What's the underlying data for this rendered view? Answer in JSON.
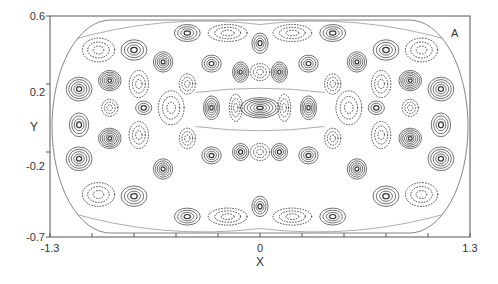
{
  "chart_data": {
    "type": "contour",
    "title": "",
    "panel_label": "A",
    "xlabel": "X",
    "ylabel": "Y",
    "xlim": [
      -1.3,
      1.3
    ],
    "ylim": [
      -0.7,
      0.6
    ],
    "x_ticks": [
      {
        "value": -1.3,
        "label": "-1.3"
      },
      {
        "value": 0,
        "label": "0"
      },
      {
        "value": 1.3,
        "label": "1.3"
      }
    ],
    "x_minor_ticks": [
      -1.04,
      -0.78,
      -0.52,
      -0.26,
      0.26,
      0.52,
      0.78,
      1.04
    ],
    "y_ticks": [
      {
        "value": 0.6,
        "label": "0.6"
      },
      {
        "value": 0.2,
        "label": "0.2"
      },
      {
        "value": -0.2,
        "label": "-0.2"
      },
      {
        "value": -0.7,
        "label": "-0.7"
      }
    ],
    "grid": false,
    "legend": null,
    "boundary": "stadium (rounded ends) enclosing the field, symmetric about x=0 and y≈-0.05",
    "line_styles": {
      "positive": "solid",
      "negative": "dotted"
    },
    "lobes": [
      {
        "x": -1.12,
        "y": 0.17,
        "rx": 0.08,
        "ry": 0.07,
        "sign": "+",
        "levels": 5
      },
      {
        "x": -1.12,
        "y": -0.24,
        "rx": 0.08,
        "ry": 0.07,
        "sign": "+",
        "levels": 5
      },
      {
        "x": -1.12,
        "y": -0.04,
        "rx": 0.06,
        "ry": 0.07,
        "sign": "+",
        "levels": 4
      },
      {
        "x": -0.93,
        "y": 0.22,
        "rx": 0.07,
        "ry": 0.06,
        "sign": "+",
        "levels": 6
      },
      {
        "x": -0.93,
        "y": -0.12,
        "rx": 0.07,
        "ry": 0.06,
        "sign": "+",
        "levels": 6
      },
      {
        "x": -0.93,
        "y": 0.06,
        "rx": 0.05,
        "ry": 0.05,
        "sign": "-",
        "levels": 3
      },
      {
        "x": -0.78,
        "y": 0.4,
        "rx": 0.08,
        "ry": 0.06,
        "sign": "+",
        "levels": 4
      },
      {
        "x": -0.78,
        "y": -0.46,
        "rx": 0.08,
        "ry": 0.06,
        "sign": "+",
        "levels": 4
      },
      {
        "x": -0.72,
        "y": 0.06,
        "rx": 0.05,
        "ry": 0.04,
        "sign": "+",
        "levels": 3
      },
      {
        "x": -0.6,
        "y": 0.33,
        "rx": 0.06,
        "ry": 0.06,
        "sign": "+",
        "levels": 5
      },
      {
        "x": -0.6,
        "y": -0.3,
        "rx": 0.06,
        "ry": 0.06,
        "sign": "+",
        "levels": 5
      },
      {
        "x": -0.45,
        "y": 0.5,
        "rx": 0.08,
        "ry": 0.05,
        "sign": "+",
        "levels": 4
      },
      {
        "x": -0.45,
        "y": -0.58,
        "rx": 0.08,
        "ry": 0.05,
        "sign": "+",
        "levels": 4
      },
      {
        "x": -0.3,
        "y": 0.06,
        "rx": 0.05,
        "ry": 0.07,
        "sign": "+",
        "levels": 5
      },
      {
        "x": -0.3,
        "y": 0.32,
        "rx": 0.06,
        "ry": 0.05,
        "sign": "+",
        "levels": 4
      },
      {
        "x": -0.3,
        "y": -0.22,
        "rx": 0.06,
        "ry": 0.05,
        "sign": "+",
        "levels": 4
      },
      {
        "x": -0.12,
        "y": 0.27,
        "rx": 0.05,
        "ry": 0.06,
        "sign": "+",
        "levels": 5
      },
      {
        "x": -0.12,
        "y": -0.2,
        "rx": 0.05,
        "ry": 0.05,
        "sign": "+",
        "levels": 4
      },
      {
        "x": 0.0,
        "y": 0.06,
        "rx": 0.12,
        "ry": 0.06,
        "sign": "+",
        "levels": 6
      },
      {
        "x": 0.0,
        "y": 0.44,
        "rx": 0.05,
        "ry": 0.06,
        "sign": "+",
        "levels": 4
      },
      {
        "x": 0.0,
        "y": -0.52,
        "rx": 0.05,
        "ry": 0.06,
        "sign": "+",
        "levels": 4
      },
      {
        "x": 0.12,
        "y": 0.27,
        "rx": 0.05,
        "ry": 0.06,
        "sign": "+",
        "levels": 5
      },
      {
        "x": 0.12,
        "y": -0.2,
        "rx": 0.05,
        "ry": 0.05,
        "sign": "+",
        "levels": 4
      },
      {
        "x": 0.3,
        "y": 0.06,
        "rx": 0.05,
        "ry": 0.07,
        "sign": "+",
        "levels": 5
      },
      {
        "x": 0.3,
        "y": 0.32,
        "rx": 0.06,
        "ry": 0.05,
        "sign": "+",
        "levels": 4
      },
      {
        "x": 0.3,
        "y": -0.22,
        "rx": 0.06,
        "ry": 0.05,
        "sign": "+",
        "levels": 4
      },
      {
        "x": 0.45,
        "y": 0.5,
        "rx": 0.08,
        "ry": 0.05,
        "sign": "+",
        "levels": 4
      },
      {
        "x": 0.45,
        "y": -0.58,
        "rx": 0.08,
        "ry": 0.05,
        "sign": "+",
        "levels": 4
      },
      {
        "x": 0.6,
        "y": 0.33,
        "rx": 0.06,
        "ry": 0.06,
        "sign": "+",
        "levels": 5
      },
      {
        "x": 0.6,
        "y": -0.3,
        "rx": 0.06,
        "ry": 0.06,
        "sign": "+",
        "levels": 5
      },
      {
        "x": 0.72,
        "y": 0.06,
        "rx": 0.05,
        "ry": 0.04,
        "sign": "+",
        "levels": 3
      },
      {
        "x": 0.78,
        "y": 0.4,
        "rx": 0.08,
        "ry": 0.06,
        "sign": "+",
        "levels": 4
      },
      {
        "x": 0.78,
        "y": -0.46,
        "rx": 0.08,
        "ry": 0.06,
        "sign": "+",
        "levels": 4
      },
      {
        "x": 0.93,
        "y": 0.22,
        "rx": 0.07,
        "ry": 0.06,
        "sign": "+",
        "levels": 6
      },
      {
        "x": 0.93,
        "y": -0.12,
        "rx": 0.07,
        "ry": 0.06,
        "sign": "+",
        "levels": 6
      },
      {
        "x": 0.93,
        "y": 0.06,
        "rx": 0.05,
        "ry": 0.05,
        "sign": "-",
        "levels": 3
      },
      {
        "x": 1.12,
        "y": 0.17,
        "rx": 0.08,
        "ry": 0.07,
        "sign": "+",
        "levels": 5
      },
      {
        "x": 1.12,
        "y": -0.24,
        "rx": 0.08,
        "ry": 0.07,
        "sign": "+",
        "levels": 5
      },
      {
        "x": 1.12,
        "y": -0.04,
        "rx": 0.06,
        "ry": 0.07,
        "sign": "+",
        "levels": 4
      },
      {
        "x": -1.0,
        "y": 0.4,
        "rx": 0.1,
        "ry": 0.07,
        "sign": "-",
        "levels": 3
      },
      {
        "x": -1.0,
        "y": -0.45,
        "rx": 0.1,
        "ry": 0.07,
        "sign": "-",
        "levels": 3
      },
      {
        "x": 1.0,
        "y": 0.4,
        "rx": 0.1,
        "ry": 0.07,
        "sign": "-",
        "levels": 3
      },
      {
        "x": 1.0,
        "y": -0.45,
        "rx": 0.1,
        "ry": 0.07,
        "sign": "-",
        "levels": 3
      },
      {
        "x": -0.55,
        "y": 0.06,
        "rx": 0.08,
        "ry": 0.1,
        "sign": "-",
        "levels": 3
      },
      {
        "x": 0.55,
        "y": 0.06,
        "rx": 0.08,
        "ry": 0.1,
        "sign": "-",
        "levels": 3
      },
      {
        "x": -0.15,
        "y": 0.06,
        "rx": 0.04,
        "ry": 0.08,
        "sign": "-",
        "levels": 3
      },
      {
        "x": 0.15,
        "y": 0.06,
        "rx": 0.04,
        "ry": 0.08,
        "sign": "-",
        "levels": 3
      },
      {
        "x": 0.0,
        "y": 0.27,
        "rx": 0.06,
        "ry": 0.05,
        "sign": "-",
        "levels": 3
      },
      {
        "x": 0.0,
        "y": -0.2,
        "rx": 0.06,
        "ry": 0.05,
        "sign": "-",
        "levels": 3
      },
      {
        "x": -0.2,
        "y": 0.5,
        "rx": 0.12,
        "ry": 0.05,
        "sign": "-",
        "levels": 3
      },
      {
        "x": 0.2,
        "y": 0.5,
        "rx": 0.12,
        "ry": 0.05,
        "sign": "-",
        "levels": 3
      },
      {
        "x": -0.2,
        "y": -0.58,
        "rx": 0.12,
        "ry": 0.05,
        "sign": "-",
        "levels": 3
      },
      {
        "x": 0.2,
        "y": -0.58,
        "rx": 0.12,
        "ry": 0.05,
        "sign": "-",
        "levels": 3
      },
      {
        "x": -0.75,
        "y": 0.2,
        "rx": 0.06,
        "ry": 0.08,
        "sign": "-",
        "levels": 3
      },
      {
        "x": -0.75,
        "y": -0.1,
        "rx": 0.06,
        "ry": 0.08,
        "sign": "-",
        "levels": 3
      },
      {
        "x": 0.75,
        "y": 0.2,
        "rx": 0.06,
        "ry": 0.08,
        "sign": "-",
        "levels": 3
      },
      {
        "x": 0.75,
        "y": -0.1,
        "rx": 0.06,
        "ry": 0.08,
        "sign": "-",
        "levels": 3
      },
      {
        "x": -0.45,
        "y": 0.2,
        "rx": 0.05,
        "ry": 0.06,
        "sign": "-",
        "levels": 3
      },
      {
        "x": -0.45,
        "y": -0.12,
        "rx": 0.05,
        "ry": 0.06,
        "sign": "-",
        "levels": 3
      },
      {
        "x": 0.45,
        "y": 0.2,
        "rx": 0.05,
        "ry": 0.06,
        "sign": "-",
        "levels": 3
      },
      {
        "x": 0.45,
        "y": -0.12,
        "rx": 0.05,
        "ry": 0.06,
        "sign": "-",
        "levels": 3
      }
    ],
    "colors": {
      "line": "#333333",
      "background": "#ffffff"
    }
  }
}
